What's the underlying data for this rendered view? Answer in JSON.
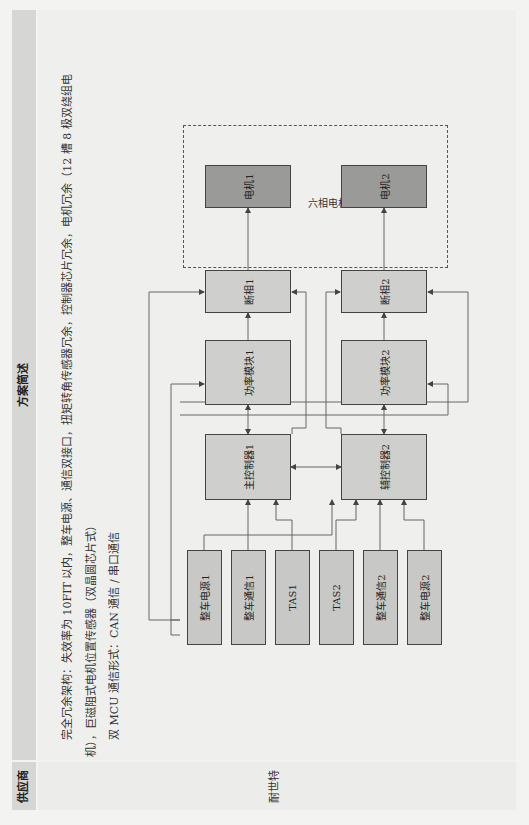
{
  "page_number": "…",
  "table": {
    "headers": {
      "supplier": "供应商",
      "description": "方案简述"
    },
    "rows": [
      {
        "supplier": "耐世特",
        "description_lines": [
          "完全冗余架构：失效率为 10FIT 以内，整车电源、通信双接口，扭矩转角传感器冗余，控制器芯片冗余，电机冗余（12 槽 8 极双绕组电",
          "机），巨磁阻式电机位置传感器（双晶圆芯片式）",
          "双 MCU 通信形式：CAN 通信 / 串口通信"
        ]
      }
    ]
  },
  "diagram": {
    "motor_group_label": "六相电机",
    "channel1": {
      "inputs": [
        "整车电源1",
        "整车通信1",
        "TAS1"
      ],
      "controller": "主控制器1",
      "power_module": "功率模块1",
      "phase_cut": "断相1",
      "motor": "电机1"
    },
    "channel2": {
      "inputs": [
        "TAS2",
        "整车通信2",
        "整车电源2"
      ],
      "controller": "辅控制器2",
      "power_module": "功率模块2",
      "phase_cut": "断相2",
      "motor": "电机2"
    },
    "colors": {
      "box": "#cfcfcd",
      "motor": "#9a9a98",
      "line": "#555555"
    }
  }
}
